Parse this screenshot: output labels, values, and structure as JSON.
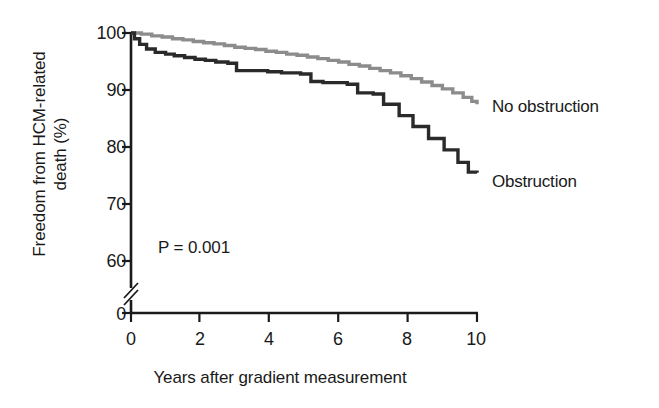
{
  "chart_data": {
    "type": "line",
    "subtype": "kaplan-meier-step",
    "title": "",
    "xlabel": "Years after gradient measurement",
    "ylabel": "Freedom from HCM-related death (%)",
    "ylabel_line1": "Freedom from HCM-related",
    "ylabel_line2": "death (%)",
    "xlim": [
      0,
      10
    ],
    "ylim": [
      60,
      100
    ],
    "y_axis_break": true,
    "y_axis_break_note": "axis broken between 60 and 0",
    "grid": false,
    "legend_position": "right-of-curve-ends",
    "xticks": [
      0,
      2,
      4,
      6,
      8,
      10
    ],
    "xtick_labels": [
      "0",
      "2",
      "4",
      "6",
      "8",
      "10"
    ],
    "yticks": [
      100,
      90,
      80,
      70,
      60,
      0
    ],
    "ytick_labels": [
      "100",
      "90",
      "80",
      "70",
      "60",
      "0"
    ],
    "annotations": [
      {
        "text": "P = 0.001",
        "x": 0.8,
        "y": 63
      }
    ],
    "series": [
      {
        "name": "No obstruction",
        "color": "#8c8c8c",
        "label": "No obstruction",
        "points": [
          [
            0.0,
            100.0
          ],
          [
            0.3,
            99.8
          ],
          [
            0.6,
            99.5
          ],
          [
            0.9,
            99.3
          ],
          [
            1.2,
            99.0
          ],
          [
            1.5,
            98.8
          ],
          [
            1.8,
            98.5
          ],
          [
            2.1,
            98.3
          ],
          [
            2.4,
            98.1
          ],
          [
            2.7,
            97.8
          ],
          [
            3.0,
            97.5
          ],
          [
            3.3,
            97.3
          ],
          [
            3.6,
            97.1
          ],
          [
            3.9,
            96.8
          ],
          [
            4.2,
            96.6
          ],
          [
            4.5,
            96.3
          ],
          [
            4.8,
            96.1
          ],
          [
            5.1,
            95.8
          ],
          [
            5.4,
            95.5
          ],
          [
            5.7,
            95.2
          ],
          [
            6.0,
            94.9
          ],
          [
            6.3,
            94.5
          ],
          [
            6.6,
            94.2
          ],
          [
            6.9,
            93.8
          ],
          [
            7.2,
            93.4
          ],
          [
            7.5,
            93.0
          ],
          [
            7.8,
            92.5
          ],
          [
            8.1,
            92.0
          ],
          [
            8.4,
            91.4
          ],
          [
            8.7,
            90.8
          ],
          [
            9.0,
            90.2
          ],
          [
            9.3,
            89.5
          ],
          [
            9.6,
            88.7
          ],
          [
            9.85,
            88.0
          ],
          [
            10.0,
            87.5
          ]
        ]
      },
      {
        "name": "Obstruction",
        "color": "#2a2a2a",
        "label": "Obstruction",
        "points": [
          [
            0.0,
            100.0
          ],
          [
            0.1,
            99.0
          ],
          [
            0.25,
            98.0
          ],
          [
            0.45,
            97.2
          ],
          [
            0.7,
            96.6
          ],
          [
            1.0,
            96.3
          ],
          [
            1.25,
            96.0
          ],
          [
            1.55,
            95.7
          ],
          [
            1.85,
            95.4
          ],
          [
            2.15,
            95.2
          ],
          [
            2.45,
            94.9
          ],
          [
            2.8,
            94.7
          ],
          [
            3.05,
            93.4
          ],
          [
            3.95,
            93.2
          ],
          [
            4.35,
            93.0
          ],
          [
            4.9,
            92.8
          ],
          [
            5.2,
            91.5
          ],
          [
            5.55,
            91.3
          ],
          [
            6.25,
            91.0
          ],
          [
            6.55,
            89.5
          ],
          [
            7.0,
            89.3
          ],
          [
            7.3,
            87.5
          ],
          [
            7.75,
            85.5
          ],
          [
            8.15,
            83.6
          ],
          [
            8.6,
            81.5
          ],
          [
            9.05,
            79.5
          ],
          [
            9.45,
            77.3
          ],
          [
            9.75,
            75.6
          ],
          [
            10.0,
            75.5
          ]
        ]
      }
    ]
  },
  "axes": {
    "ytick_100": "100",
    "ytick_90": "90",
    "ytick_80": "80",
    "ytick_70": "70",
    "ytick_60": "60",
    "ytick_0": "0",
    "xtick_0": "0",
    "xtick_2": "2",
    "xtick_4": "4",
    "xtick_6": "6",
    "xtick_8": "8",
    "xtick_10": "10"
  },
  "labels": {
    "x_axis_title": "Years after gradient measurement",
    "y_axis_title_line1": "Freedom from HCM-related",
    "y_axis_title_line2": "death (%)",
    "p_value": "P = 0.001",
    "series_no_obstruction": "No obstruction",
    "series_obstruction": "Obstruction"
  },
  "colors": {
    "no_obstruction": "#8c8c8c",
    "obstruction": "#2a2a2a",
    "axis": "#1a1a1a",
    "background": "#ffffff"
  }
}
